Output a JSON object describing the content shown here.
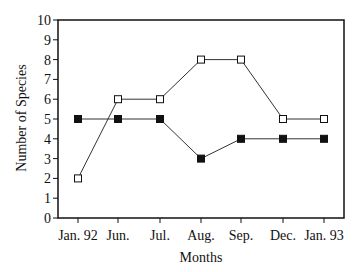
{
  "chart_data": {
    "type": "line",
    "title": "",
    "xlabel": "Months",
    "ylabel": "Number of Species",
    "categories": [
      "Jan. 92",
      "Jun.",
      "Jul.",
      "Aug.",
      "Sep.",
      "Dec.",
      "Jan. 93"
    ],
    "series": [
      {
        "name": "Open squares",
        "marker": "open-square",
        "values": [
          2,
          6,
          6,
          8,
          8,
          5,
          5
        ]
      },
      {
        "name": "Filled squares",
        "marker": "filled-square",
        "values": [
          5,
          5,
          5,
          3,
          4,
          4,
          4
        ]
      }
    ],
    "ylim": [
      0,
      10
    ],
    "yticks": [
      0,
      1,
      2,
      3,
      4,
      5,
      6,
      7,
      8,
      9,
      10
    ],
    "grid": false,
    "legend": "none"
  }
}
